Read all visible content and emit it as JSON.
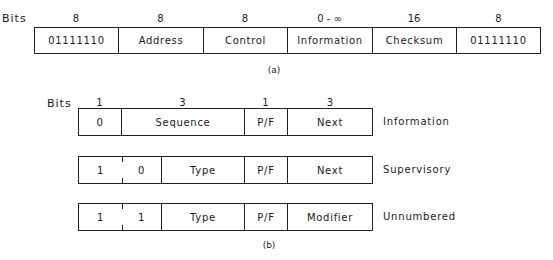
{
  "figure_a": {
    "bits_label": "Bits",
    "fields": [
      {
        "bits": "8",
        "label": "01111110"
      },
      {
        "bits": "8",
        "label": "Address"
      },
      {
        "bits": "8",
        "label": "Control"
      },
      {
        "bits": "0 - ∞",
        "label": "Information"
      },
      {
        "bits": "16",
        "label": "Checksum"
      },
      {
        "bits": "8",
        "label": "01111110"
      }
    ],
    "caption": "(a)"
  },
  "figure_b": {
    "bits_label": "Bits",
    "bit_widths": [
      "1",
      "3",
      "1",
      "3"
    ],
    "rows": [
      {
        "name": "Information",
        "cells": [
          "0",
          "Sequence",
          "P/F",
          "Next"
        ]
      },
      {
        "name": "Supervisory",
        "cells": [
          "1",
          "0",
          "Type",
          "P/F",
          "Next"
        ]
      },
      {
        "name": "Unnumbered",
        "cells": [
          "1",
          "1",
          "Type",
          "P/F",
          "Modifier"
        ]
      }
    ],
    "caption": "(b)"
  }
}
